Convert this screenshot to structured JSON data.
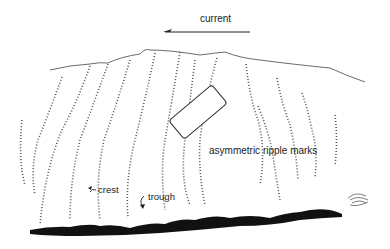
{
  "figure": {
    "labels": {
      "current": "current",
      "ripple_marks": "asymmetric ripple marks",
      "crest": "crest",
      "trough": "trough"
    },
    "current_direction": "left",
    "colors": {
      "ink": "#222222",
      "sediment_base": "#111111",
      "background": "#ffffff"
    }
  }
}
